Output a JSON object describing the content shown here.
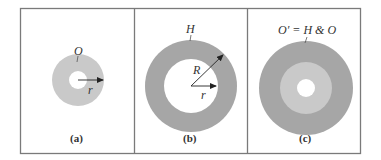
{
  "figure": {
    "colors": {
      "frame": "#7a7a7a",
      "light_gray": "#c9c9c9",
      "dark_gray": "#a6a6a6",
      "hole": "#ffffff",
      "arrow": "#222222"
    },
    "panels": [
      {
        "id": "a",
        "caption": "(a)",
        "region_label": "O",
        "radius_labels": [
          "r"
        ],
        "description": "Light gray annulus O with small hole; arrow r from center"
      },
      {
        "id": "b",
        "caption": "(b)",
        "region_label": "H",
        "radius_labels": [
          "R",
          "r"
        ],
        "description": "Dark gray annulus H with outer radius R and inner radius r"
      },
      {
        "id": "c",
        "caption": "(c)",
        "region_label": "O′ = H & O",
        "radius_labels": [],
        "description": "Union: dark outer ring H, light middle ring O, white hole"
      }
    ]
  }
}
